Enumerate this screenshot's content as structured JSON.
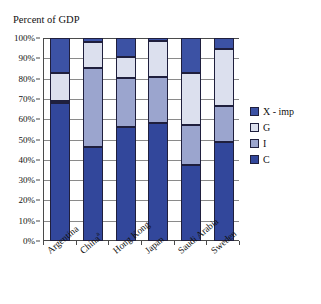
{
  "chart_data": {
    "type": "bar",
    "subtype": "stacked-column-100",
    "title": "Percent of GDP",
    "xlabel": "",
    "ylabel": "",
    "ylim": [
      0,
      100
    ],
    "ytick_labels": [
      "100%",
      "90%",
      "80%",
      "70%",
      "60%",
      "50%",
      "40%",
      "30%",
      "20%",
      "10%",
      "0%"
    ],
    "ytick_values": [
      100,
      90,
      80,
      70,
      60,
      50,
      40,
      30,
      20,
      10,
      0
    ],
    "grid": true,
    "legend_position": "right",
    "categories": [
      "Argentina",
      "China",
      "Hong Kong",
      "Japan",
      "Saudi Arabia",
      "Sweden"
    ],
    "category_labels": [
      "Argentina",
      "Chinaᵃ",
      "Hong Kong",
      "Japan",
      "Saudi Arabia",
      "Sweden"
    ],
    "category_footnotes": [
      "",
      "a",
      "",
      "",
      "",
      ""
    ],
    "stack_order_bottom_to_top": [
      "C",
      "I",
      "G",
      "X - imp"
    ],
    "series": [
      {
        "name": "C",
        "color": "#32479B",
        "values": [
          68.0,
          46.5,
          56.0,
          58.0,
          37.5,
          49.0
        ]
      },
      {
        "name": "I",
        "color": "#9BA5CE",
        "values": [
          1.0,
          38.5,
          24.5,
          23.0,
          19.5,
          17.5
        ]
      },
      {
        "name": "G",
        "color": "#DCE0EE",
        "values": [
          14.0,
          13.0,
          10.0,
          17.5,
          26.0,
          28.0
        ]
      },
      {
        "name": "X - imp",
        "color": "#3C52A4",
        "values": [
          17.0,
          2.0,
          9.5,
          1.5,
          17.0,
          5.5
        ]
      }
    ],
    "series_colors": {
      "X - imp": "#3C52A4",
      "G": "#DCE0EE",
      "I": "#9BA5CE",
      "C": "#32479B"
    },
    "legend_entries": [
      "X - imp",
      "G",
      "I",
      "C"
    ],
    "axis_color": "#4a4a4a",
    "gridline_color": "#8a8a8a",
    "bar_outline_color": "#1f1f3d",
    "background_color": "#ffffff"
  }
}
